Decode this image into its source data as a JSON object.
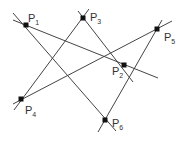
{
  "diagram": {
    "type": "point-line configuration",
    "points": [
      {
        "id": "P1",
        "label": "P",
        "sub": "1",
        "x": 26,
        "y": 25,
        "lx": 28,
        "ly": 13
      },
      {
        "id": "P2",
        "label": "P",
        "sub": "2",
        "x": 124,
        "y": 65,
        "lx": 112,
        "ly": 66
      },
      {
        "id": "P3",
        "label": "P",
        "sub": "3",
        "x": 83,
        "y": 18,
        "lx": 90,
        "ly": 12
      },
      {
        "id": "P4",
        "label": "P",
        "sub": "4",
        "x": 21,
        "y": 99,
        "lx": 25,
        "ly": 105
      },
      {
        "id": "P5",
        "label": "P",
        "sub": "5",
        "x": 157,
        "y": 29,
        "lx": 164,
        "ly": 32
      },
      {
        "id": "P6",
        "label": "P",
        "sub": "6",
        "x": 105,
        "y": 120,
        "lx": 112,
        "ly": 118
      }
    ],
    "lines": [
      {
        "through": [
          "P1",
          "P2"
        ],
        "x1": 13,
        "y1": 20,
        "x2": 158,
        "y2": 78
      },
      {
        "through": [
          "P1",
          "P6"
        ],
        "x1": 13,
        "y1": 13,
        "x2": 116,
        "y2": 131
      },
      {
        "through": [
          "P3",
          "P4"
        ],
        "x1": 89,
        "y1": 9,
        "x2": 14,
        "y2": 110
      },
      {
        "through": [
          "P3",
          "P2"
        ],
        "x1": 78,
        "y1": 11,
        "x2": 133,
        "y2": 82
      },
      {
        "through": [
          "P4",
          "P5"
        ],
        "x1": 13,
        "y1": 104,
        "x2": 172,
        "y2": 21
      },
      {
        "through": [
          "P5",
          "P6"
        ],
        "x1": 162,
        "y1": 20,
        "x2": 98,
        "y2": 132
      }
    ],
    "colors": {
      "line": "#444444",
      "point": "#111111",
      "label": "#333333"
    }
  }
}
